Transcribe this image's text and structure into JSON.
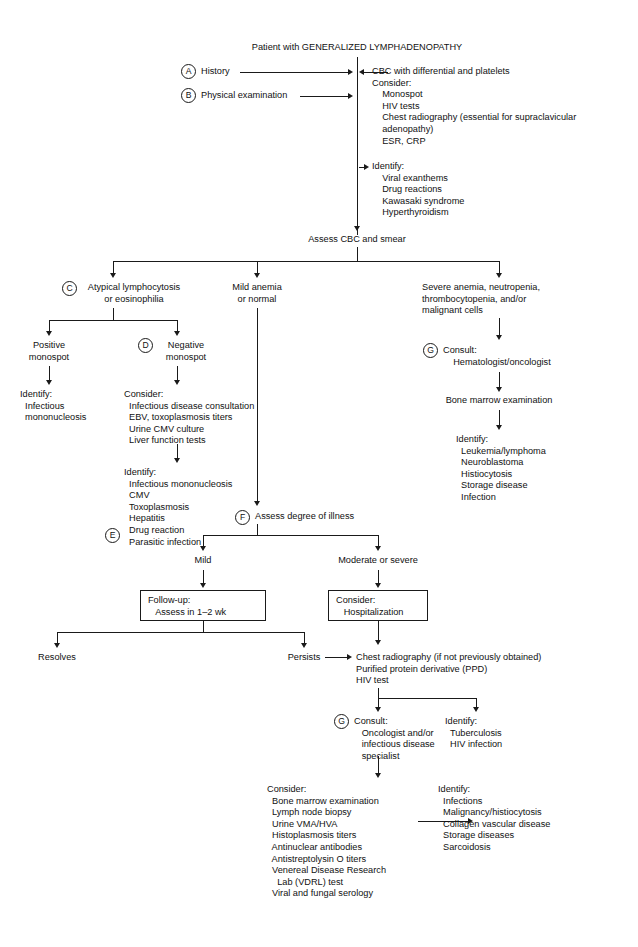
{
  "diagram": {
    "title": "Patient with GENERALIZED LYMPHADENOPATHY",
    "type": "clinical-algorithm-flowchart"
  },
  "markers": {
    "a": "A",
    "b": "B",
    "c": "C",
    "d": "D",
    "e": "E",
    "f": "F",
    "g1": "G",
    "g2": "G"
  },
  "nodes": {
    "history": "History",
    "physical_exam": "Physical examination",
    "initial_workup": "CBC with differential and platelets\nConsider:\n    Monospot\n    HIV tests\n    Chest radiography (essential for supraclavicular\n    adenopathy)\n    ESR, CRP",
    "initial_identify": "Identify:\n    Viral exanthems\n    Drug reactions\n    Kawasaki syndrome\n    Hyperthyroidism",
    "assess_cbc": "Assess CBC and smear",
    "branch_atypical": "Atypical lymphocytosis\nor eosinophilia",
    "branch_mild": "Mild anemia\nor normal",
    "branch_severe": "Severe anemia, neutropenia,\nthrombocytopenia, and/or\nmalignant cells",
    "positive_monospot": "Positive\nmonospot",
    "negative_monospot": "Negative\nmonospot",
    "positive_identify": "Identify:\n  Infectious\n  mononucleosis",
    "negative_consider": "Consider:\n  Infectious disease consultation\n  EBV, toxoplasmosis titers\n  Urine CMV culture\n  Liver function tests",
    "negative_identify": "Identify:\n  Infectious mononucleosis\n  CMV\n  Toxoplasmosis\n  Hepatitis\n  Drug reaction\n  Parasitic infection",
    "consult_hemonc": "Consult:\n    Hematologist/oncologist",
    "bone_marrow": "Bone marrow examination",
    "marrow_identify": "Identify:\n  Leukemia/lymphoma\n  Neuroblastoma\n  Histiocytosis\n  Storage disease\n  Infection",
    "assess_illness": "Assess degree of illness",
    "mild": "Mild",
    "moderate_severe": "Moderate or severe",
    "followup_box": "Follow-up:\n   Assess in 1–2 wk",
    "hospitalization_box": "Consider:\n   Hospitalization",
    "resolves": "Resolves",
    "persists": "Persists",
    "second_workup": "Chest radiography (if not previously obtained)\nPurified protein derivative (PPD)\nHIV test",
    "consult_oncology": "Consult:\n   Oncologist and/or\n   infectious disease\n   specialist",
    "tb_identify": "Identify:\n  Tuberculosis\n  HIV infection",
    "final_consider": "Consider:\n  Bone marrow examination\n  Lymph node biopsy\n  Urine VMA/HVA\n  Histoplasmosis titers\n  Antinuclear antibodies\n  Antistreptolysin O titers\n  Venereal Disease Research\n    Lab (VDRL) test\n  Viral and fungal serology",
    "final_identify": "Identify:\n  Infections\n  Malignancy/histiocytosis\n  Collagen vascular disease\n  Storage diseases\n  Sarcoidosis"
  },
  "colors": {
    "ink": "#111111",
    "line": "#1a1a1a",
    "background": "#ffffff"
  }
}
